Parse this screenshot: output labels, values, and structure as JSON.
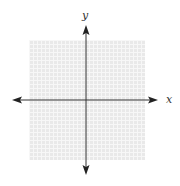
{
  "diagram": {
    "type": "coordinate-plane",
    "axes": {
      "x_label": "x",
      "y_label": "y",
      "axis_color": "#333333"
    },
    "grid": {
      "background_color": "#e9e9e9",
      "line_color": "#f7f7f7"
    }
  }
}
